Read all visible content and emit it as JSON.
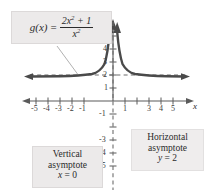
{
  "chart_data": {
    "type": "line",
    "title": "",
    "function_label": {
      "lhs": "g(x)",
      "equals": "=",
      "numerator": "2x² + 1",
      "denominator": "x²",
      "full": "g(x) = (2x² + 1)/x²"
    },
    "xlabel": "x",
    "ylabel": "y",
    "xlim": [
      -6.1,
      6.1
    ],
    "ylim": [
      -6.0,
      5.6
    ],
    "grid": false,
    "legend": "none",
    "x_tick_labels": [
      "-5",
      "-4",
      "-3",
      "-2",
      "-1",
      "1",
      "3",
      "4",
      "5"
    ],
    "x_tick_values": [
      -5,
      -4,
      -3,
      -2,
      -1,
      1,
      3,
      4,
      5
    ],
    "y_tick_labels": [
      "4",
      "3",
      "2",
      "1",
      "-1",
      "-3",
      "-4",
      "-5"
    ],
    "y_tick_values": [
      4,
      3,
      2,
      1,
      -1,
      -3,
      -4,
      -5
    ],
    "series": [
      {
        "name": "g(x) = (2x^2 + 1)/x^2",
        "color": "#4a4a4a",
        "branches": [
          {
            "name": "left-branch",
            "x": [
              -6.0,
              -5.0,
              -4.0,
              -3.0,
              -2.5,
              -2.0,
              -1.6,
              -1.3,
              -1.1,
              -0.95,
              -0.85,
              -0.75,
              -0.68,
              -0.62,
              -0.57,
              -0.53,
              -0.5,
              -0.47
            ],
            "y": [
              2.03,
              2.04,
              2.06,
              2.11,
              2.16,
              2.25,
              2.39,
              2.59,
              2.83,
              3.11,
              3.38,
              3.78,
              4.16,
              4.6,
              5.08,
              5.56,
              6.0,
              6.5
            ]
          },
          {
            "name": "right-branch",
            "x": [
              0.47,
              0.5,
              0.53,
              0.57,
              0.62,
              0.68,
              0.75,
              0.85,
              0.95,
              1.1,
              1.3,
              1.6,
              2.0,
              2.5,
              3.0,
              4.0,
              5.0,
              6.0
            ],
            "y": [
              6.5,
              6.0,
              5.56,
              5.08,
              4.6,
              4.16,
              3.78,
              3.38,
              3.11,
              2.83,
              2.59,
              2.39,
              2.25,
              2.16,
              2.11,
              2.06,
              2.04,
              2.03
            ]
          }
        ]
      }
    ],
    "asymptotes": [
      {
        "name": "vertical-asymptote",
        "orientation": "vertical",
        "equation": "x = 0",
        "value": 0,
        "style": "dashed",
        "label_lines": [
          "Vertical",
          "asymptote",
          "x = 0"
        ]
      },
      {
        "name": "horizontal-asymptote",
        "orientation": "horizontal",
        "equation": "y = 2",
        "value": 2,
        "style": "dashed",
        "label_lines": [
          "Horizontal",
          "asymptote",
          "y = 2"
        ]
      }
    ],
    "colors": {
      "curve": "#4a4a4a",
      "axis": "#5a5a5a",
      "asymptote": "#6d6d6d",
      "callout_background": "#eceaea",
      "callout_border": "#dcd9d9",
      "text": "#2b2b2b",
      "background": "#ffffff"
    }
  },
  "labels": {
    "vertical_asymptote": {
      "line1": "Vertical",
      "line2": "asymptote",
      "line3_var": "x",
      "line3_rest": " = 0"
    },
    "horizontal_asymptote": {
      "line1": "Horizontal",
      "line2": "asymptote",
      "line3_var": "y",
      "line3_rest": " = 2"
    },
    "axis_x": "x",
    "axis_y": "y"
  },
  "ticks": {
    "x": [
      {
        "label": "-5",
        "px": 36
      },
      {
        "label": "-4",
        "px": 48
      },
      {
        "label": "-3",
        "px": 60
      },
      {
        "label": "-2",
        "px": 72
      },
      {
        "label": "-1",
        "px": 84
      },
      {
        "label": "1",
        "px": 125
      },
      {
        "label": "3",
        "px": 149
      },
      {
        "label": "4",
        "px": 161
      },
      {
        "label": "5",
        "px": 173
      }
    ],
    "y": [
      {
        "label": "4",
        "px": 49
      },
      {
        "label": "3",
        "px": 62
      },
      {
        "label": "2",
        "px": 75
      },
      {
        "label": "1",
        "px": 88
      },
      {
        "label": "-1",
        "px": 114
      },
      {
        "label": "-3",
        "px": 140
      },
      {
        "label": "-4",
        "px": 153
      },
      {
        "label": "-5",
        "px": 166
      }
    ]
  }
}
